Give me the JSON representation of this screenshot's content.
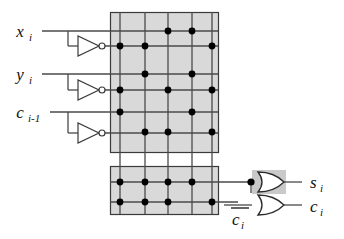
{
  "figure": {
    "type": "logic-circuit-diagram",
    "background_color": "#ffffff",
    "plane_fill": "#d9d9d9",
    "line_color": "#2b2b2b",
    "dot_color": "#000000"
  },
  "inputs": [
    {
      "id": "x",
      "base": "x",
      "sub": "i",
      "y": 31
    },
    {
      "id": "y",
      "base": "y",
      "sub": "i",
      "y": 74
    },
    {
      "id": "c",
      "base": "c",
      "sub": "i-1",
      "y": 118
    }
  ],
  "inverters": [
    {
      "name": "inverter-x",
      "y": 46
    },
    {
      "name": "inverter-y",
      "y": 90
    },
    {
      "name": "inverter-c",
      "y": 133
    }
  ],
  "and_plane": {
    "name": "and-plane",
    "x": 110,
    "y": 12,
    "width": 108,
    "height": 140,
    "product_columns": [
      120,
      145,
      168,
      192,
      212
    ],
    "rows": [
      {
        "label": "x_i",
        "y": 31,
        "dots": [
          168,
          192
        ]
      },
      {
        "label": "x_i'",
        "y": 46,
        "dots": [
          120,
          145,
          212
        ]
      },
      {
        "label": "y_i",
        "y": 74,
        "dots": [
          145,
          192
        ]
      },
      {
        "label": "y_i'",
        "y": 90,
        "dots": [
          120,
          168,
          212
        ]
      },
      {
        "label": "c_i-1",
        "y": 112,
        "dots": [
          120,
          192
        ]
      },
      {
        "label": "c_i-1'",
        "y": 132,
        "dots": [
          145,
          168,
          212
        ]
      }
    ]
  },
  "or_plane": {
    "name": "or-plane",
    "x": 110,
    "y": 166,
    "width": 108,
    "height": 48,
    "rows": [
      {
        "label": "s_i-term",
        "y": 182,
        "dots": [
          120,
          145,
          168,
          192
        ]
      },
      {
        "label": "c_i-term",
        "y": 200,
        "dots": [
          120,
          145,
          168,
          212
        ]
      }
    ]
  },
  "gates": [
    {
      "name": "or-gate-sum",
      "type": "or",
      "x": 258,
      "y": 182,
      "highlight": true
    },
    {
      "name": "or-gate-carry",
      "type": "or",
      "x": 258,
      "y": 202,
      "highlight": false
    }
  ],
  "outputs": [
    {
      "id": "s",
      "base": "s",
      "sub": "i",
      "x": 308,
      "y": 182
    },
    {
      "id": "c",
      "base": "c",
      "sub": "i",
      "x": 308,
      "y": 205
    }
  ],
  "feedback": {
    "name": "carry-feedback",
    "base": "c",
    "sub": "i",
    "overbar": true,
    "x": 232,
    "y": 217
  }
}
